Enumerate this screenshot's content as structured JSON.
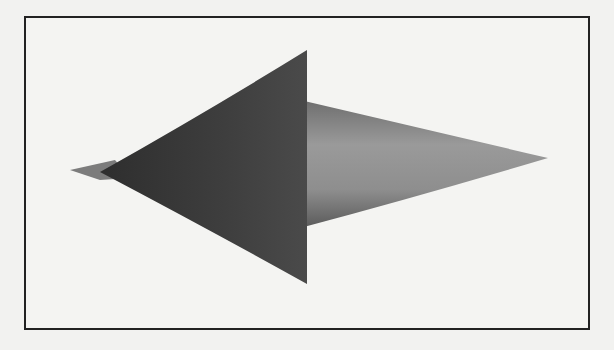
{
  "figure": {
    "colors": {
      "background": "#f2f2f0",
      "frame_border": "#222222",
      "dark_cone": "#3a3a3a",
      "light_cone": "#8a8a8a",
      "tip_sliver": "#7a7a7a"
    }
  }
}
